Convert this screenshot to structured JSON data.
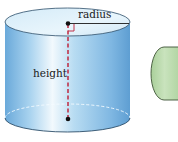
{
  "diagram": {
    "labels": {
      "radius": "radius",
      "height": "height"
    },
    "shapes": [
      {
        "name": "cylinder",
        "color": "#8fc3e8"
      },
      {
        "name": "partial-green-cylinder",
        "color": "#b9d9ac"
      }
    ],
    "colors": {
      "cylinder_light": "#e6f3fb",
      "cylinder_mid": "#a8d2ef",
      "cylinder_dark": "#5f9fd3",
      "height_line": "#c0334a",
      "right_angle": "#c0334a",
      "points": "#111111",
      "green_fill": "#b9d9ac",
      "green_outline": "#3d5236"
    }
  }
}
